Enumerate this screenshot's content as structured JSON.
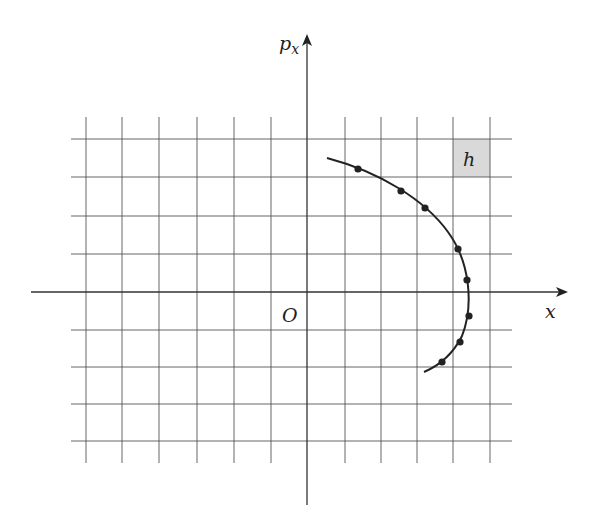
{
  "diagram": {
    "type": "phase-space-plot",
    "axes": {
      "horizontal_label": "x",
      "vertical_label": "p",
      "vertical_label_subscript": "x",
      "origin_label": "O"
    },
    "cell_label": "h",
    "colors": {
      "grid": "#555555",
      "axis": "#333333",
      "curve": "#222222",
      "cell_fill": "#d9d9d9",
      "background": "#ffffff"
    },
    "grid": {
      "x_lines": [
        86,
        122,
        159,
        197,
        234,
        271,
        345,
        381,
        417,
        453,
        490
      ],
      "y_lines": [
        139,
        177,
        216,
        254,
        330,
        367,
        404,
        441
      ],
      "x_extent": [
        71,
        512
      ],
      "y_extent": [
        117,
        463
      ]
    },
    "origin_px": [
      307,
      292
    ],
    "highlighted_cell_px": {
      "x": 453,
      "y": 139,
      "w": 37,
      "h": 38
    },
    "trajectory_points_px": [
      [
        358,
        169
      ],
      [
        401,
        191
      ],
      [
        425,
        208
      ],
      [
        458,
        249
      ],
      [
        467,
        280
      ],
      [
        469,
        316
      ],
      [
        460,
        342
      ],
      [
        442,
        362
      ]
    ]
  }
}
